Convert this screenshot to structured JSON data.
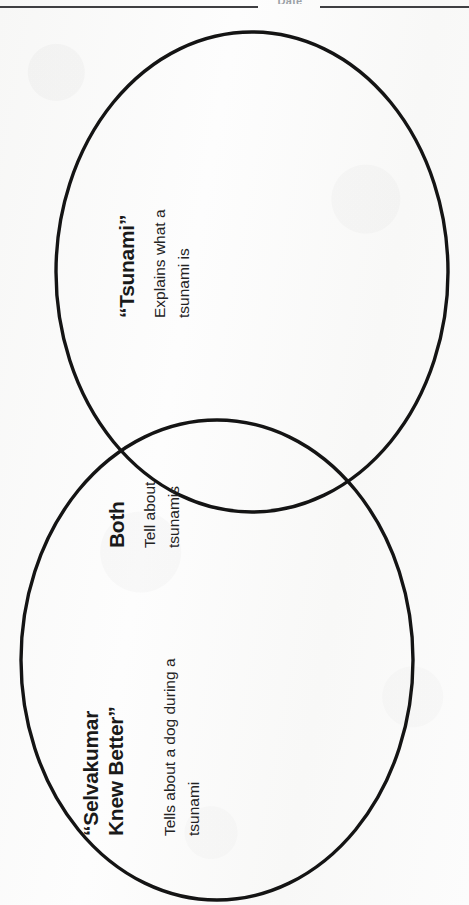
{
  "worksheet": {
    "header": {
      "field_label": "Date",
      "rule_left": "horizontal-rule",
      "rule_right": "horizontal-rule"
    },
    "diagram": {
      "type": "venn-diagram",
      "orientation": "page-rotated-90-ccw",
      "circle_count": 2,
      "stroke_color": "#141414",
      "background_color": "#fbfbfb"
    },
    "regions": [
      {
        "id": "tsunami",
        "position": "upper-circle",
        "title": "“Tsunami”",
        "body_lines": [
          "Explains what a",
          "tsunami is"
        ],
        "body_text": "Explains what a tsunami is"
      },
      {
        "id": "both",
        "position": "overlap",
        "title": "Both",
        "body_lines": [
          "Tell about",
          "tsunamis"
        ],
        "body_text": "Tell about tsunamis"
      },
      {
        "id": "selvakumar",
        "position": "lower-circle",
        "title_lines": [
          "“Selvakumar",
          "Knew Better”"
        ],
        "title": "“Selvakumar Knew Better”",
        "body_lines": [
          "Tells about a dog during a",
          "tsunami"
        ],
        "body_text": "Tells about a dog during a tsunami"
      }
    ]
  }
}
